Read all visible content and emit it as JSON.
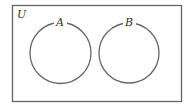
{
  "diagram": {
    "type": "venn",
    "universe": {
      "label": "U",
      "x": 12,
      "y": 5,
      "width": 169,
      "height": 96
    },
    "sets": [
      {
        "label": "A",
        "cx": 60.5,
        "cy": 53,
        "r": 30.5
      },
      {
        "label": "B",
        "cx": 129,
        "cy": 53,
        "r": 30
      }
    ],
    "relationship": "disjoint",
    "colors": {
      "stroke": "#666666",
      "text": "#333333",
      "background": "#ffffff"
    }
  }
}
